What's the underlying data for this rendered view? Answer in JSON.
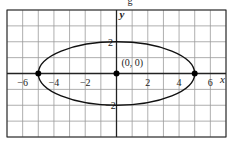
{
  "chart_data": {
    "type": "line",
    "title": "",
    "top_caption_fragment": "g",
    "xlabel": "x",
    "ylabel": "y",
    "xlim": [
      -7,
      7
    ],
    "ylim": [
      -4,
      4
    ],
    "grid": true,
    "grid_step": 1,
    "x_ticks": [
      {
        "value": -6,
        "label": "−6"
      },
      {
        "value": -4,
        "label": "−4"
      },
      {
        "value": -2,
        "label": "−2"
      },
      {
        "value": 2,
        "label": "2"
      },
      {
        "value": 4,
        "label": "4"
      },
      {
        "value": 6,
        "label": "6"
      }
    ],
    "y_ticks": [
      {
        "value": 2,
        "label": "2"
      },
      {
        "value": -2,
        "label": "−2"
      }
    ],
    "series": [
      {
        "name": "ellipse",
        "shape": "ellipse",
        "center": [
          0,
          0
        ],
        "semi_major_x": 5,
        "semi_minor_y": 2,
        "equation": "x^2/25 + y^2/4 = 1"
      }
    ],
    "points": [
      {
        "x": -5,
        "y": 0,
        "label": ""
      },
      {
        "x": 0,
        "y": 0,
        "label": "(0, 0)"
      },
      {
        "x": 5,
        "y": 0,
        "label": ""
      }
    ],
    "annotations": [
      {
        "text": "(0, 0)",
        "x": 0,
        "y": 0
      }
    ],
    "colors": {
      "grid": "#9a9a9a",
      "axis": "#222222",
      "curve": "#111111",
      "point": "#000000",
      "background": "#ffffff"
    }
  }
}
